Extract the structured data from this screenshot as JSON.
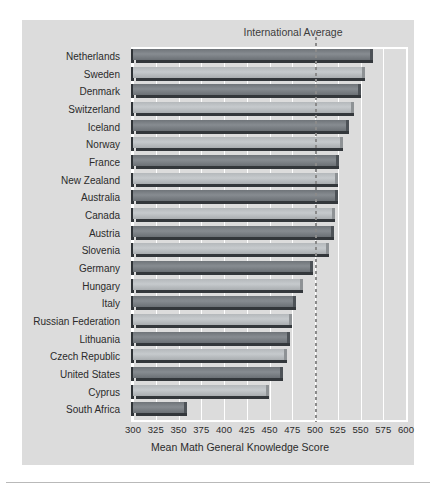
{
  "chart_data": {
    "type": "bar",
    "orientation": "horizontal",
    "title": "",
    "xlabel": "Mean Math General Knowledge Score",
    "ylabel": "",
    "xlim": [
      300,
      600
    ],
    "xticks": [
      300,
      325,
      350,
      375,
      400,
      425,
      450,
      475,
      500,
      525,
      550,
      575,
      600
    ],
    "grid": true,
    "legend": "none",
    "annotations": [
      {
        "name": "international-average",
        "label": "International Average",
        "value": 500,
        "style": "dotted vertical line"
      }
    ],
    "categories": [
      "Netherlands",
      "Sweden",
      "Denmark",
      "Switzerland",
      "Iceland",
      "Norway",
      "France",
      "New Zealand",
      "Australia",
      "Canada",
      "Austria",
      "Slovenia",
      "Germany",
      "Hungary",
      "Italy",
      "Russian Federation",
      "Lithuania",
      "Czech Republic",
      "United States",
      "Cyprus",
      "South Africa"
    ],
    "values": [
      560,
      552,
      547,
      540,
      534,
      528,
      523,
      522,
      522,
      519,
      518,
      512,
      495,
      483,
      476,
      471,
      469,
      466,
      461,
      446,
      356
    ]
  },
  "axis": {
    "x_title": "Mean Math General Knowledge Score",
    "tick_labels": [
      "300",
      "325",
      "350",
      "375",
      "400",
      "425",
      "450",
      "475",
      "500",
      "525",
      "550",
      "575",
      "600"
    ]
  },
  "annotation": {
    "international_average_label": "International Average"
  },
  "colors": {
    "panel_background": "#dcdcdc",
    "page_background": "#ffffff",
    "bar_dark": "#6f7479",
    "bar_light": "#b4b8bb",
    "bar_shadow": "#33373b",
    "gridline": "#ffffff",
    "text": "#2b2b2b",
    "average_line": "#8a8a8a"
  }
}
